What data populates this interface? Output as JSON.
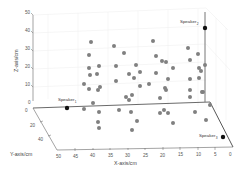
{
  "chart_data": {
    "type": "scatter",
    "projection": "3d",
    "title": "",
    "xlabel": "X-axis/cm",
    "ylabel": "Y-axis/cm",
    "zlabel": "Z-axis/cm",
    "xlim": [
      0,
      50
    ],
    "ylim": [
      0,
      50
    ],
    "zlim": [
      0,
      50
    ],
    "x_ticks": [
      "50",
      "45",
      "40",
      "35",
      "30",
      "25",
      "20",
      "15",
      "10",
      "5",
      "0"
    ],
    "y_ticks": [
      "0",
      "20",
      "40"
    ],
    "z_ticks": [
      "0",
      "10",
      "20",
      "30",
      "40",
      "50"
    ],
    "grid": true,
    "point_color": "#808080",
    "speaker_color": "#000000",
    "speakers": [
      {
        "label": "Speaker",
        "sub": "1",
        "x": 42,
        "y": 0,
        "z": 0
      },
      {
        "label": "Speaker",
        "sub": "2",
        "x": 0,
        "y": 0,
        "z": 40
      },
      {
        "label": "Speaker",
        "sub": "3",
        "x": 2,
        "y": 50,
        "z": 0
      }
    ],
    "series": [
      {
        "name": "grid points",
        "screen_points": [
          [
            91,
            42
          ],
          [
            114,
            46
          ],
          [
            153,
            41
          ],
          [
            188,
            48
          ],
          [
            198,
            54
          ],
          [
            89,
            55
          ],
          [
            124,
            53
          ],
          [
            156,
            56
          ],
          [
            162,
            61
          ],
          [
            166,
            62
          ],
          [
            190,
            60
          ],
          [
            89,
            68
          ],
          [
            99,
            66
          ],
          [
            116,
            66
          ],
          [
            136,
            65
          ],
          [
            173,
            68
          ],
          [
            199,
            68
          ],
          [
            201,
            71
          ],
          [
            205,
            65
          ],
          [
            90,
            75
          ],
          [
            97,
            74
          ],
          [
            129,
            74
          ],
          [
            134,
            78
          ],
          [
            140,
            72
          ],
          [
            156,
            73
          ],
          [
            168,
            79
          ],
          [
            190,
            79
          ],
          [
            199,
            78
          ],
          [
            84,
            84
          ],
          [
            89,
            89
          ],
          [
            100,
            87
          ],
          [
            98,
            90
          ],
          [
            116,
            81
          ],
          [
            140,
            86
          ],
          [
            149,
            84
          ],
          [
            165,
            88
          ],
          [
            166,
            90
          ],
          [
            190,
            90
          ],
          [
            202,
            92
          ],
          [
            126,
            97
          ],
          [
            132,
            95
          ],
          [
            160,
            98
          ],
          [
            190,
            97
          ],
          [
            93,
            103
          ],
          [
            129,
            100
          ],
          [
            203,
            92
          ],
          [
            84,
            109
          ],
          [
            99,
            112
          ],
          [
            119,
            110
          ],
          [
            131,
            112
          ],
          [
            160,
            113
          ],
          [
            164,
            110
          ],
          [
            168,
            113
          ],
          [
            195,
            112
          ],
          [
            210,
            105
          ],
          [
            206,
            120
          ],
          [
            98,
            122
          ],
          [
            137,
            121
          ],
          [
            173,
            123
          ],
          [
            99,
            128
          ],
          [
            132,
            130
          ]
        ]
      }
    ]
  }
}
